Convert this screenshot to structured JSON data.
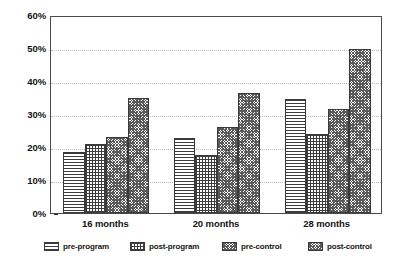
{
  "chart_data": {
    "type": "bar",
    "title": "",
    "subtitle": "",
    "xlabel": "",
    "ylabel": "",
    "ylim": [
      0,
      60
    ],
    "ytick_labels": [
      "60%",
      "50%",
      "40%",
      "30%",
      "20%",
      "10%",
      "0%"
    ],
    "ytick_values": [
      60,
      50,
      40,
      30,
      20,
      10,
      0
    ],
    "grid": true,
    "grid_axis": "y",
    "legend_position": "bottom",
    "categories": [
      "16 months",
      "20 months",
      "28 months"
    ],
    "series": [
      {
        "name": "pre-program",
        "pattern": "horizontal-lines",
        "values": [
          18.5,
          22.7,
          34.4
        ]
      },
      {
        "name": "post-program",
        "pattern": "cross-hatch-grid",
        "values": [
          20.8,
          17.6,
          24.0
        ]
      },
      {
        "name": "pre-control",
        "pattern": "dense-dither",
        "values": [
          23.1,
          26.1,
          31.4
        ]
      },
      {
        "name": "post-control",
        "pattern": "dense-dither",
        "values": [
          34.8,
          36.4,
          49.7
        ]
      }
    ],
    "colors": {
      "axis": "#4a4a4a",
      "gridline": "#b9b9b9",
      "bar_outline": "#3a3a3a",
      "bar_fill": "#ffffff",
      "hatch": "#3c3c3c",
      "text": "#141414",
      "background": "#ffffff"
    }
  },
  "legend": {
    "items": [
      {
        "label": "pre-program"
      },
      {
        "label": "post-program"
      },
      {
        "label": "pre-control"
      },
      {
        "label": "post-control"
      }
    ]
  }
}
